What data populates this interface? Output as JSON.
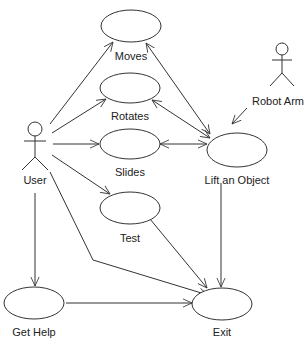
{
  "diagram": {
    "type": "UML use case diagram",
    "colors": {
      "line": "#333333",
      "text": "#222222",
      "background": "#ffffff"
    },
    "actors": [
      {
        "id": "user",
        "label": "User"
      },
      {
        "id": "robot_arm",
        "label": "Robot Arm"
      }
    ],
    "use_cases": [
      {
        "id": "moves",
        "label": "Moves"
      },
      {
        "id": "rotates",
        "label": "Rotates"
      },
      {
        "id": "slides",
        "label": "Slides"
      },
      {
        "id": "lift",
        "label": "Lift an Object"
      },
      {
        "id": "test",
        "label": "Test"
      },
      {
        "id": "get_help",
        "label": "Get Help"
      },
      {
        "id": "exit",
        "label": "Exit"
      }
    ],
    "edges": [
      {
        "from": "User",
        "to": "Moves"
      },
      {
        "from": "User",
        "to": "Rotates"
      },
      {
        "from": "User",
        "to": "Slides"
      },
      {
        "from": "User",
        "to": "Test"
      },
      {
        "from": "User",
        "to": "Get Help"
      },
      {
        "from": "User",
        "to": "Exit"
      },
      {
        "from": "Moves",
        "to": "Lift an Object",
        "bidirectional": true
      },
      {
        "from": "Rotates",
        "to": "Lift an Object",
        "bidirectional": true
      },
      {
        "from": "Slides",
        "to": "Lift an Object",
        "bidirectional": true
      },
      {
        "from": "Robot Arm",
        "to": "Lift an Object"
      },
      {
        "from": "Lift an Object",
        "to": "Exit"
      },
      {
        "from": "Test",
        "to": "Exit"
      },
      {
        "from": "Get Help",
        "to": "Exit"
      }
    ]
  }
}
